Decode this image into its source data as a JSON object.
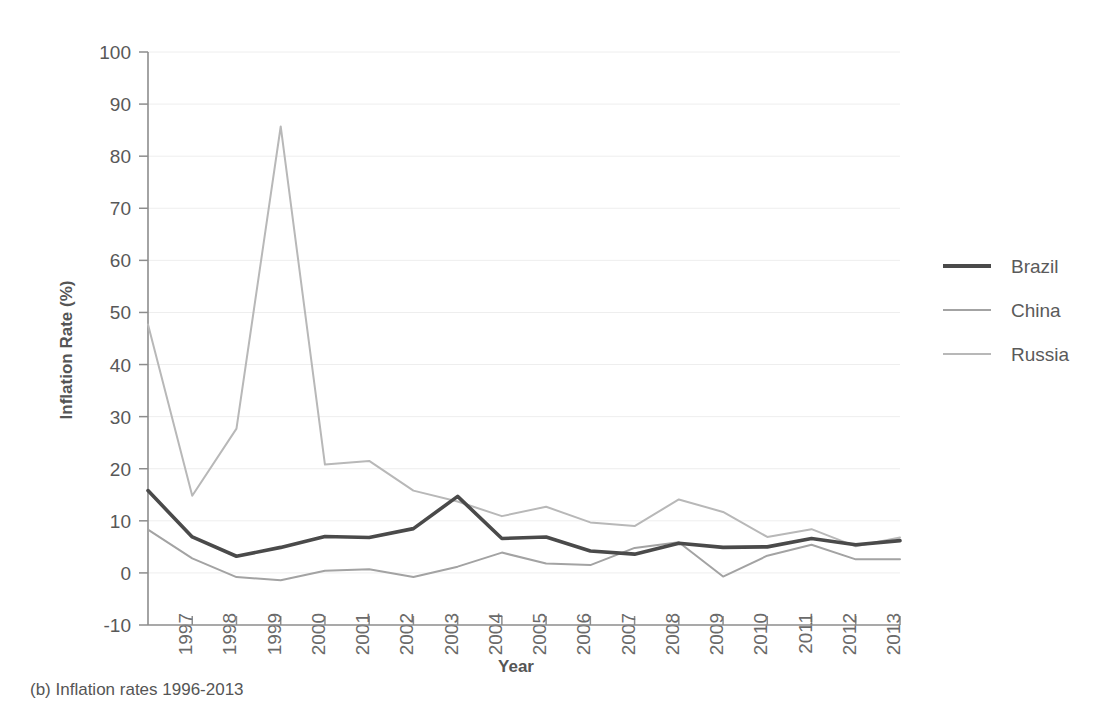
{
  "caption": "(b) Inflation rates 1996-2013",
  "chart_data": {
    "type": "line",
    "title": "",
    "xlabel": "Year",
    "ylabel": "Inflation Rate (%)",
    "x": [
      1996,
      1997,
      1998,
      1999,
      2000,
      2001,
      2002,
      2003,
      2004,
      2005,
      2006,
      2007,
      2008,
      2009,
      2010,
      2011,
      2012,
      2013
    ],
    "categories": [
      "1996",
      "1997",
      "1998",
      "1999",
      "2000",
      "2001",
      "2002",
      "2003",
      "2004",
      "2005",
      "2006",
      "2007",
      "2008",
      "2009",
      "2010",
      "2011",
      "2012",
      "2013"
    ],
    "xtick_labels": [
      "1997",
      "1998",
      "1999",
      "2000",
      "2001",
      "2002",
      "2003",
      "2004",
      "2005",
      "2006",
      "2007",
      "2008",
      "2009",
      "2010",
      "2011",
      "2012",
      "2013"
    ],
    "ytick_labels": [
      "100",
      "90",
      "80",
      "70",
      "60",
      "50",
      "40",
      "30",
      "20",
      "10",
      "0",
      "-10"
    ],
    "ytick_values": [
      100,
      90,
      80,
      70,
      60,
      50,
      40,
      30,
      20,
      10,
      0,
      -10
    ],
    "ylim": [
      -10,
      100
    ],
    "xlim": [
      1996,
      2013
    ],
    "grid": true,
    "legend_position": "right",
    "series": [
      {
        "name": "Brazil",
        "color": "#4a4a4a",
        "width": 3.6,
        "values": [
          15.8,
          6.9,
          3.2,
          4.9,
          7.0,
          6.8,
          8.5,
          14.7,
          6.6,
          6.9,
          4.2,
          3.6,
          5.7,
          4.9,
          5.0,
          6.6,
          5.4,
          6.2
        ]
      },
      {
        "name": "China",
        "color": "#a3a3a3",
        "width": 2.0,
        "values": [
          8.3,
          2.8,
          -0.8,
          -1.4,
          0.4,
          0.7,
          -0.8,
          1.2,
          3.9,
          1.8,
          1.5,
          4.8,
          5.9,
          -0.7,
          3.3,
          5.4,
          2.6,
          2.6
        ]
      },
      {
        "name": "Russia",
        "color": "#b8b8b8",
        "width": 2.0,
        "values": [
          47.7,
          14.8,
          27.7,
          85.7,
          20.8,
          21.5,
          15.8,
          13.7,
          10.9,
          12.7,
          9.7,
          9.0,
          14.1,
          11.7,
          6.9,
          8.4,
          5.1,
          6.8
        ]
      }
    ]
  },
  "legend": {
    "items": [
      {
        "label": "Brazil",
        "color": "#4a4a4a",
        "width": 4.0
      },
      {
        "label": "China",
        "color": "#a3a3a3",
        "width": 2.0
      },
      {
        "label": "Russia",
        "color": "#b8b8b8",
        "width": 2.0
      }
    ]
  }
}
